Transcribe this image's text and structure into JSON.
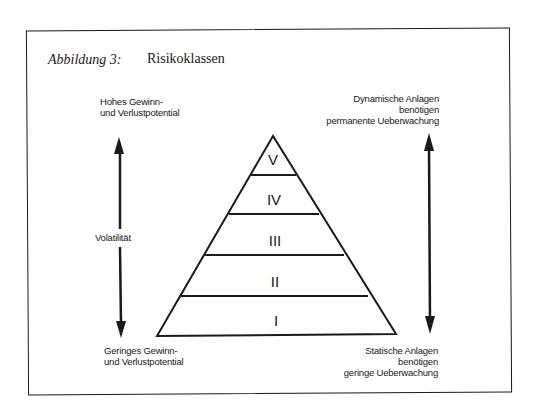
{
  "figure": {
    "label": "Abbildung 3:",
    "title": "Risikoklassen"
  },
  "left_axis": {
    "top_label": [
      "Hohes Gewinn-",
      "und Verlustpotential"
    ],
    "middle_label": "Volatilität",
    "bottom_label": [
      "Geringes Gewinn-",
      "und Verlustpotential"
    ]
  },
  "right_axis": {
    "top_label": [
      "Dynamische Anlagen",
      "benötigen",
      "permanente Ueberwachung"
    ],
    "bottom_label": [
      "Statische Anlagen",
      "benötigen",
      "geringe Ueberwachung"
    ]
  },
  "pyramid": {
    "levels": [
      {
        "label": "V"
      },
      {
        "label": "IV"
      },
      {
        "label": "III"
      },
      {
        "label": "II"
      },
      {
        "label": "I"
      }
    ]
  },
  "colors": {
    "ink": "#1a1a1a",
    "background": "#ffffff"
  }
}
